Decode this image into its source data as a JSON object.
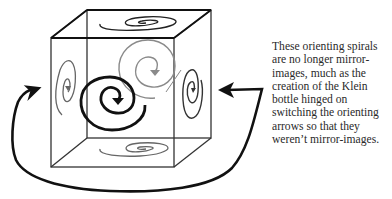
{
  "figure": {
    "colors": {
      "cube_edge": "#333333",
      "front_spiral": "#111111",
      "back_spiral": "#888888",
      "side_spiral": "#555555",
      "arrow": "#111111"
    },
    "elements": [
      {
        "name": "cube",
        "type": "wireframe-cube"
      },
      {
        "name": "top-face-spiral",
        "type": "spiral",
        "orientation": "flattened-horizontal"
      },
      {
        "name": "back-face-spiral",
        "type": "spiral",
        "tone": "gray"
      },
      {
        "name": "front-face-spiral",
        "type": "spiral",
        "tone": "black",
        "emphasis": "bold"
      },
      {
        "name": "left-face-spiral",
        "type": "spiral",
        "orientation": "tall-vertical"
      },
      {
        "name": "right-face-spiral",
        "type": "spiral",
        "orientation": "tall-vertical"
      },
      {
        "name": "bottom-face-spiral",
        "type": "spiral",
        "orientation": "flattened-horizontal"
      },
      {
        "name": "looping-arrow",
        "type": "arrow",
        "heads": [
          "left-pointing-right",
          "right-pointing-left"
        ]
      }
    ]
  },
  "caption": {
    "lines": [
      "These orienting spirals",
      "are no longer mirror-",
      "images, much as the",
      "creation of the Klein",
      "bottle hinged on",
      "switching the orienting",
      "arrows so that they",
      "weren’t mirror-images."
    ]
  }
}
